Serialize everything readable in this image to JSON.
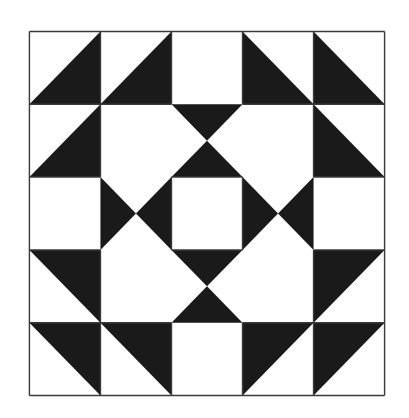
{
  "quilt": {
    "grid": {
      "cols": 5,
      "rows": 5
    },
    "colors": {
      "background": "#ffffff",
      "fill": "#1a1a1a",
      "line": "#3a3a3a"
    },
    "triangles": [
      {
        "name": "r0c0-lower-right",
        "points": "0,1 1,0 1,1"
      },
      {
        "name": "r0c1-lower-right",
        "points": "1,1 2,0 2,1"
      },
      {
        "name": "r0c3-lower-left",
        "points": "3,0 3,1 4,1"
      },
      {
        "name": "r0c4-lower-left",
        "points": "4,0 4,1 5,1"
      },
      {
        "name": "r1c0-lower-right",
        "points": "0,2 1,1 1,2"
      },
      {
        "name": "r1c4-lower-left",
        "points": "4,1 4,2 5,2"
      },
      {
        "name": "top-outer",
        "points": "2,1 3,1 2.5,1.5"
      },
      {
        "name": "top-inner",
        "points": "2,2 3,2 2.5,1.5"
      },
      {
        "name": "left-outer",
        "points": "1,2 1,3 1.5,2.5"
      },
      {
        "name": "left-inner",
        "points": "2,2 2,3 1.5,2.5"
      },
      {
        "name": "right-inner",
        "points": "3,2 3,3 3.5,2.5"
      },
      {
        "name": "right-outer",
        "points": "4,2 4,3 3.5,2.5"
      },
      {
        "name": "bottom-inner",
        "points": "2,3 3,3 2.5,3.5"
      },
      {
        "name": "bottom-outer",
        "points": "2,4 3,4 2.5,3.5"
      },
      {
        "name": "r3c0-upper-right",
        "points": "0,3 1,3 1,4"
      },
      {
        "name": "r3c4-upper-left",
        "points": "4,3 5,3 4,4"
      },
      {
        "name": "r4c0-upper-right",
        "points": "0,4 1,4 1,5"
      },
      {
        "name": "r4c1-upper-right",
        "points": "1,4 2,4 2,5"
      },
      {
        "name": "r4c3-upper-left",
        "points": "3,4 4,4 3,5"
      },
      {
        "name": "r4c4-upper-left",
        "points": "4,4 5,4 4,5"
      }
    ],
    "grid_lines": [
      {
        "name": "v0",
        "x1": 0,
        "y1": 0,
        "x2": 0,
        "y2": 5
      },
      {
        "name": "v1-top",
        "x1": 1,
        "y1": 0,
        "x2": 1,
        "y2": 2
      },
      {
        "name": "v1-bottom",
        "x1": 1,
        "y1": 3,
        "x2": 1,
        "y2": 5
      },
      {
        "name": "v2-top",
        "x1": 2,
        "y1": 0,
        "x2": 2,
        "y2": 1
      },
      {
        "name": "v2-mid",
        "x1": 2,
        "y1": 2,
        "x2": 2,
        "y2": 3
      },
      {
        "name": "v2-bottom",
        "x1": 2,
        "y1": 4,
        "x2": 2,
        "y2": 5
      },
      {
        "name": "v3-top",
        "x1": 3,
        "y1": 0,
        "x2": 3,
        "y2": 1
      },
      {
        "name": "v3-mid",
        "x1": 3,
        "y1": 2,
        "x2": 3,
        "y2": 3
      },
      {
        "name": "v3-bottom",
        "x1": 3,
        "y1": 4,
        "x2": 3,
        "y2": 5
      },
      {
        "name": "v4-top",
        "x1": 4,
        "y1": 0,
        "x2": 4,
        "y2": 2
      },
      {
        "name": "v4-bottom",
        "x1": 4,
        "y1": 3,
        "x2": 4,
        "y2": 5
      },
      {
        "name": "v5",
        "x1": 5,
        "y1": 0,
        "x2": 5,
        "y2": 5
      },
      {
        "name": "h0",
        "x1": 0,
        "y1": 0,
        "x2": 5,
        "y2": 0
      },
      {
        "name": "h1-left",
        "x1": 0,
        "y1": 1,
        "x2": 2,
        "y2": 1
      },
      {
        "name": "h1-right",
        "x1": 3,
        "y1": 1,
        "x2": 5,
        "y2": 1
      },
      {
        "name": "h2-left",
        "x1": 0,
        "y1": 2,
        "x2": 1,
        "y2": 2
      },
      {
        "name": "h2-mid",
        "x1": 2,
        "y1": 2,
        "x2": 3,
        "y2": 2
      },
      {
        "name": "h2-right",
        "x1": 4,
        "y1": 2,
        "x2": 5,
        "y2": 2
      },
      {
        "name": "h3-left",
        "x1": 0,
        "y1": 3,
        "x2": 1,
        "y2": 3
      },
      {
        "name": "h3-mid",
        "x1": 2,
        "y1": 3,
        "x2": 3,
        "y2": 3
      },
      {
        "name": "h3-right",
        "x1": 4,
        "y1": 3,
        "x2": 5,
        "y2": 3
      },
      {
        "name": "h4-left",
        "x1": 0,
        "y1": 4,
        "x2": 2,
        "y2": 4
      },
      {
        "name": "h4-right",
        "x1": 3,
        "y1": 4,
        "x2": 5,
        "y2": 4
      },
      {
        "name": "h5",
        "x1": 0,
        "y1": 5,
        "x2": 5,
        "y2": 5
      }
    ]
  }
}
